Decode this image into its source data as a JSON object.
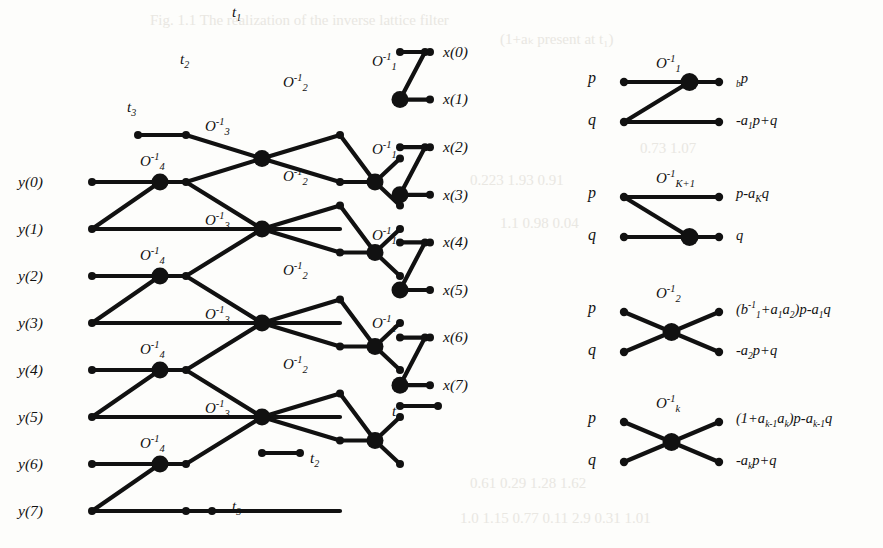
{
  "figure": {
    "kind": "signal-flow-graph"
  },
  "inputs": {
    "label_prefix": "y",
    "items": [
      {
        "label": "y(0)",
        "row": 0
      },
      {
        "label": "y(1)",
        "row": 1
      },
      {
        "label": "y(2)",
        "row": 2
      },
      {
        "label": "y(3)",
        "row": 3
      },
      {
        "label": "y(4)",
        "row": 4
      },
      {
        "label": "y(5)",
        "row": 5
      },
      {
        "label": "y(6)",
        "row": 6
      },
      {
        "label": "y(7)",
        "row": 7
      }
    ]
  },
  "outputs": {
    "label_prefix": "x",
    "items": [
      {
        "label": "x(0)",
        "row": 0
      },
      {
        "label": "x(1)",
        "row": 1
      },
      {
        "label": "x(2)",
        "row": 2
      },
      {
        "label": "x(3)",
        "row": 3
      },
      {
        "label": "x(4)",
        "row": 4
      },
      {
        "label": "x(5)",
        "row": 5
      },
      {
        "label": "x(6)",
        "row": 6
      },
      {
        "label": "x(7)",
        "row": 7
      }
    ]
  },
  "terminals": {
    "top": [
      {
        "label": "t",
        "sub": "1"
      },
      {
        "label": "t",
        "sub": "2"
      },
      {
        "label": "t",
        "sub": "3"
      }
    ],
    "bottom": [
      {
        "label": "t",
        "sub": "1"
      },
      {
        "label": "t",
        "sub": "2"
      },
      {
        "label": "t",
        "sub": "3"
      }
    ]
  },
  "stage_operators": {
    "stage4": {
      "base": "O",
      "sup": "-1",
      "sub": "4",
      "count": 4
    },
    "stage3": {
      "base": "O",
      "sup": "-1",
      "sub": "3",
      "count": 4
    },
    "stage2": {
      "base": "O",
      "sup": "-1",
      "sub": "2",
      "count": 4
    },
    "stage1": {
      "base": "O",
      "sup": "-1",
      "sub": "1",
      "count": 4
    }
  },
  "legend": {
    "entries": [
      {
        "name": "legend-O1",
        "operator": {
          "base": "O",
          "sup": "-1",
          "sub": "1"
        },
        "in_top": "p",
        "in_bottom": "q",
        "out_top": "b₁p",
        "out_bottom": "-a₁p+q",
        "out_top_parts": [
          {
            "t": "b",
            "k": "sub",
            "v": "1"
          },
          {
            "t": "p",
            "k": "base"
          }
        ],
        "out_bottom_parts": [
          {
            "t": "-a",
            "k": "base"
          },
          {
            "t": "1",
            "k": "sub"
          },
          {
            "t": "p+q",
            "k": "base"
          }
        ],
        "node_position": "top",
        "cross": false
      },
      {
        "name": "legend-OK1",
        "operator": {
          "base": "O",
          "sup": "-1",
          "sub": "K+1"
        },
        "in_top": "p",
        "in_bottom": "q",
        "out_top": "p-aₖq",
        "out_bottom": "q",
        "out_top_parts": [
          {
            "t": "p-a",
            "k": "base"
          },
          {
            "t": "K",
            "k": "sub"
          },
          {
            "t": "q",
            "k": "base"
          }
        ],
        "out_bottom_parts": [
          {
            "t": "q",
            "k": "base"
          }
        ],
        "node_position": "bottom",
        "cross": false
      },
      {
        "name": "legend-O2",
        "operator": {
          "base": "O",
          "sup": "-1",
          "sub": "2"
        },
        "in_top": "p",
        "in_bottom": "q",
        "out_top": "(b⁻¹₁+a₁a₂)p-a₁q",
        "out_bottom": "-a₂p+q",
        "out_top_parts": [
          {
            "t": "(b",
            "k": "base"
          },
          {
            "t": "-1",
            "k": "sup"
          },
          {
            "t": "1",
            "k": "sub"
          },
          {
            "t": "+a",
            "k": "base"
          },
          {
            "t": "1",
            "k": "sub"
          },
          {
            "t": "a",
            "k": "base"
          },
          {
            "t": "2",
            "k": "sub"
          },
          {
            "t": ")p-a",
            "k": "base"
          },
          {
            "t": "1",
            "k": "sub"
          },
          {
            "t": "q",
            "k": "base"
          }
        ],
        "out_bottom_parts": [
          {
            "t": "-a",
            "k": "base"
          },
          {
            "t": "2",
            "k": "sub"
          },
          {
            "t": "p+q",
            "k": "base"
          }
        ],
        "node_position": "center",
        "cross": true
      },
      {
        "name": "legend-Ok",
        "operator": {
          "base": "O",
          "sup": "-1",
          "sub": "k"
        },
        "in_top": "p",
        "in_bottom": "q",
        "out_top": "(1+aₖ₋₁aₖ)p-aₖ₋₁q",
        "out_bottom": "-aₖp+q",
        "out_top_parts": [
          {
            "t": "(1+a",
            "k": "base"
          },
          {
            "t": "k-1",
            "k": "sub"
          },
          {
            "t": "a",
            "k": "base"
          },
          {
            "t": "k",
            "k": "sub"
          },
          {
            "t": ")p-a",
            "k": "base"
          },
          {
            "t": "k-1",
            "k": "sub"
          },
          {
            "t": "q",
            "k": "base"
          }
        ],
        "out_bottom_parts": [
          {
            "t": "-a",
            "k": "base"
          },
          {
            "t": "k",
            "k": "sub"
          },
          {
            "t": "p+q",
            "k": "base"
          }
        ],
        "node_position": "center",
        "cross": true
      }
    ]
  },
  "colors": {
    "ink": "#111111",
    "paper": "#fdfdfb",
    "ghost": "#e9e7e2"
  },
  "geometry": {
    "left_panel": {
      "input_x": 92,
      "columns": [
        92,
        160,
        186,
        262,
        340,
        400,
        430
      ],
      "row_step": 47.0,
      "first_input_row_y": 182,
      "output_first_row_y": 52,
      "output_row_step": 47.6
    },
    "node_radius": {
      "big": 8.5,
      "small": 4.0
    }
  },
  "ghost_text": [
    {
      "t": "Fig. 1.1   The realization of the inverse lattice filter",
      "x": 150,
      "y": 12
    },
    {
      "t": "(1+aₖ present at t₁)",
      "x": 500,
      "y": 30
    },
    {
      "t": "0.73    1.07",
      "x": 640,
      "y": 140
    },
    {
      "t": "0.223   1.93    0.91",
      "x": 470,
      "y": 172
    },
    {
      "t": "1.1     0.98    0.04",
      "x": 500,
      "y": 215
    },
    {
      "t": "0.61   0.29   1.28    1.62",
      "x": 470,
      "y": 475
    },
    {
      "t": "1.0   1.15    0.77   0.11    2.9   0.31   1.01",
      "x": 460,
      "y": 510
    }
  ]
}
